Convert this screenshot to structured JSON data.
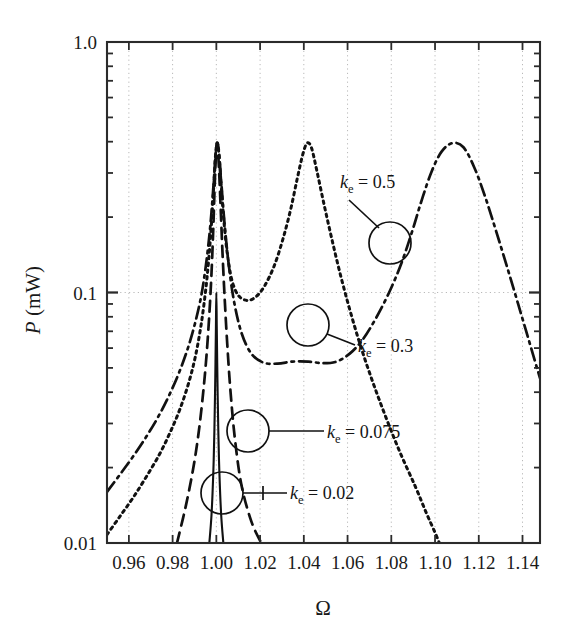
{
  "chart_data": {
    "type": "line",
    "title": "",
    "xlabel": "Ω",
    "ylabel": "P (mW)",
    "yscale": "log",
    "xlim": [
      0.95,
      1.148
    ],
    "ylim": [
      0.01,
      1.0
    ],
    "grid": true,
    "legend_position": "inline-annotations",
    "x_ticks": [
      "0.96",
      "0.98",
      "1.00",
      "1.02",
      "1.04",
      "1.06",
      "1.08",
      "1.10",
      "1.12",
      "1.14"
    ],
    "x_tick_values": [
      0.96,
      0.98,
      1.0,
      1.02,
      1.04,
      1.06,
      1.08,
      1.1,
      1.12,
      1.14
    ],
    "y_ticks": [
      "0.01",
      "0.1",
      "1.0"
    ],
    "y_tick_values": [
      0.01,
      0.1,
      1.0
    ],
    "series": [
      {
        "name": "k_e = 0.02",
        "label_base": "k",
        "label_sub": "e",
        "label_value": " = 0.02",
        "style": "solid",
        "color": "#111111",
        "points": [
          [
            0.9968,
            0.01
          ],
          [
            0.9978,
            0.013
          ],
          [
            0.9986,
            0.019
          ],
          [
            0.9991,
            0.028
          ],
          [
            0.9995,
            0.045
          ],
          [
            0.9998,
            0.072
          ],
          [
            1.0,
            0.1
          ],
          [
            1.0002,
            0.072
          ],
          [
            1.0005,
            0.045
          ],
          [
            1.0009,
            0.028
          ],
          [
            1.0014,
            0.019
          ],
          [
            1.0022,
            0.013
          ],
          [
            1.0032,
            0.01
          ]
        ]
      },
      {
        "name": "k_e = 0.075",
        "label_base": "k",
        "label_sub": "e",
        "label_value": " = 0.075",
        "style": "dashed",
        "color": "#111111",
        "points": [
          [
            0.982,
            0.01
          ],
          [
            0.986,
            0.014
          ],
          [
            0.9895,
            0.02
          ],
          [
            0.992,
            0.028
          ],
          [
            0.994,
            0.04
          ],
          [
            0.9955,
            0.056
          ],
          [
            0.9968,
            0.082
          ],
          [
            0.9978,
            0.12
          ],
          [
            0.9986,
            0.18
          ],
          [
            0.9992,
            0.26
          ],
          [
            0.9997,
            0.34
          ],
          [
            1.0002,
            0.39
          ],
          [
            1.0007,
            0.37
          ],
          [
            1.0013,
            0.3
          ],
          [
            1.002,
            0.215
          ],
          [
            1.0028,
            0.145
          ],
          [
            1.0038,
            0.095
          ],
          [
            1.005,
            0.062
          ],
          [
            1.0065,
            0.04
          ],
          [
            1.0085,
            0.026
          ],
          [
            1.0115,
            0.017
          ],
          [
            1.016,
            0.0122
          ],
          [
            1.0205,
            0.01
          ]
        ]
      },
      {
        "name": "k_e = 0.3",
        "label_base": "k",
        "label_sub": "e",
        "label_value": " = 0.3",
        "style": "dotted",
        "color": "#111111",
        "points": [
          [
            0.95,
            0.0108
          ],
          [
            0.956,
            0.0128
          ],
          [
            0.962,
            0.0152
          ],
          [
            0.968,
            0.0184
          ],
          [
            0.974,
            0.0226
          ],
          [
            0.979,
            0.0278
          ],
          [
            0.9835,
            0.0345
          ],
          [
            0.9875,
            0.044
          ],
          [
            0.9905,
            0.056
          ],
          [
            0.993,
            0.074
          ],
          [
            0.995,
            0.1
          ],
          [
            0.9965,
            0.135
          ],
          [
            0.9978,
            0.19
          ],
          [
            0.9988,
            0.265
          ],
          [
            0.9996,
            0.35
          ],
          [
            1.0003,
            0.395
          ],
          [
            1.001,
            0.37
          ],
          [
            1.002,
            0.285
          ],
          [
            1.0032,
            0.205
          ],
          [
            1.0048,
            0.148
          ],
          [
            1.007,
            0.113
          ],
          [
            1.01,
            0.0975
          ],
          [
            1.014,
            0.093
          ],
          [
            1.018,
            0.096
          ],
          [
            1.022,
            0.106
          ],
          [
            1.0265,
            0.128
          ],
          [
            1.0305,
            0.164
          ],
          [
            1.034,
            0.215
          ],
          [
            1.037,
            0.285
          ],
          [
            1.0395,
            0.355
          ],
          [
            1.0415,
            0.395
          ],
          [
            1.0435,
            0.378
          ],
          [
            1.046,
            0.305
          ],
          [
            1.049,
            0.23
          ],
          [
            1.0525,
            0.168
          ],
          [
            1.0565,
            0.12
          ],
          [
            1.061,
            0.0855
          ],
          [
            1.066,
            0.061
          ],
          [
            1.0715,
            0.044
          ],
          [
            1.0775,
            0.0318
          ],
          [
            1.084,
            0.023
          ],
          [
            1.091,
            0.0168
          ],
          [
            1.096,
            0.0132
          ],
          [
            1.1,
            0.011
          ],
          [
            1.102,
            0.01
          ]
        ]
      },
      {
        "name": "k_e = 0.5",
        "label_base": "k",
        "label_sub": "e",
        "label_value": " = 0.5",
        "style": "dashdot",
        "color": "#111111",
        "points": [
          [
            0.95,
            0.016
          ],
          [
            0.956,
            0.0188
          ],
          [
            0.962,
            0.0222
          ],
          [
            0.968,
            0.0266
          ],
          [
            0.9735,
            0.032
          ],
          [
            0.9785,
            0.039
          ],
          [
            0.983,
            0.048
          ],
          [
            0.987,
            0.06
          ],
          [
            0.9902,
            0.075
          ],
          [
            0.993,
            0.096
          ],
          [
            0.995,
            0.124
          ],
          [
            0.9966,
            0.162
          ],
          [
            0.9979,
            0.215
          ],
          [
            0.9989,
            0.285
          ],
          [
            0.9997,
            0.36
          ],
          [
            1.0004,
            0.395
          ],
          [
            1.0012,
            0.365
          ],
          [
            1.0022,
            0.28
          ],
          [
            1.0036,
            0.195
          ],
          [
            1.0055,
            0.133
          ],
          [
            1.008,
            0.093
          ],
          [
            1.0115,
            0.069
          ],
          [
            1.016,
            0.057
          ],
          [
            1.0215,
            0.0525
          ],
          [
            1.028,
            0.052
          ],
          [
            1.035,
            0.053
          ],
          [
            1.042,
            0.053
          ],
          [
            1.049,
            0.0522
          ],
          [
            1.055,
            0.053
          ],
          [
            1.061,
            0.057
          ],
          [
            1.067,
            0.065
          ],
          [
            1.073,
            0.079
          ],
          [
            1.079,
            0.1
          ],
          [
            1.0845,
            0.13
          ],
          [
            1.0895,
            0.175
          ],
          [
            1.094,
            0.235
          ],
          [
            1.0985,
            0.305
          ],
          [
            1.103,
            0.365
          ],
          [
            1.108,
            0.395
          ],
          [
            1.113,
            0.38
          ],
          [
            1.118,
            0.315
          ],
          [
            1.123,
            0.24
          ],
          [
            1.128,
            0.175
          ],
          [
            1.133,
            0.126
          ],
          [
            1.138,
            0.09
          ],
          [
            1.143,
            0.064
          ],
          [
            1.148,
            0.0455
          ]
        ]
      }
    ],
    "annotations": [
      {
        "name": "k_e = 0.5",
        "text_base": "k",
        "text_sub": "e",
        "text_value": " = 0.5",
        "text_x": 340,
        "text_y": 188,
        "circle_cx": 390,
        "circle_cy": 243,
        "circle_r": 21,
        "leader": [
          [
            349,
            200
          ],
          [
            379,
            228
          ]
        ]
      },
      {
        "name": "k_e = 0.3",
        "text_base": "k",
        "text_sub": "e",
        "text_value": " = 0.3",
        "text_x": 358,
        "text_y": 352,
        "circle_cx": 308,
        "circle_cy": 325,
        "circle_r": 21,
        "leader": [
          [
            327,
            334
          ],
          [
            355,
            345
          ]
        ]
      },
      {
        "name": "k_e = 0.075",
        "text_base": "k",
        "text_sub": "e",
        "text_value": " = 0.075",
        "text_x": 327,
        "text_y": 438,
        "circle_cx": 248,
        "circle_cy": 431,
        "circle_r": 21,
        "leader": [
          [
            269,
            431
          ],
          [
            324,
            431
          ]
        ]
      },
      {
        "name": "k_e = 0.02",
        "text_base": "k",
        "text_sub": "e",
        "text_value": " = 0.02",
        "text_x": 290,
        "text_y": 499,
        "circle_cx": 222,
        "circle_cy": 493,
        "circle_r": 21,
        "leader": [
          [
            243,
            493
          ],
          [
            287,
            493
          ]
        ],
        "tick": [
          [
            263,
            486
          ],
          [
            263,
            500
          ]
        ]
      }
    ]
  },
  "plot": {
    "left": 107,
    "right": 540,
    "top": 42,
    "bottom": 543,
    "axis_color": "#2b2b2b",
    "grid_color": "#b9b9b9"
  }
}
